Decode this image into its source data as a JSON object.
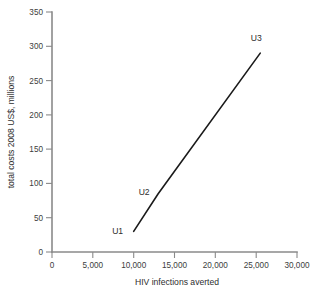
{
  "chart_data": {
    "type": "line",
    "title": "",
    "subtitle": "",
    "xlabel": "HIV infections averted",
    "ylabel": "total costs 2008 US$, millions",
    "xlim": [
      0,
      30000
    ],
    "ylim": [
      0,
      350
    ],
    "xticks": [
      0,
      5000,
      10000,
      15000,
      20000,
      25000,
      30000
    ],
    "xticklabels": [
      "0",
      "5,000",
      "10,000",
      "15,000",
      "20,000",
      "25,000",
      "30,000"
    ],
    "yticks": [
      0,
      50,
      100,
      150,
      200,
      250,
      300,
      350
    ],
    "yticklabels": [
      "0",
      "50",
      "100",
      "150",
      "200",
      "250",
      "300",
      "350"
    ],
    "grid": false,
    "legend": false,
    "legend_position": "none",
    "series": [
      {
        "name": "cost-effectiveness frontier",
        "color": "#1a1a1a",
        "x": [
          10000,
          13000,
          25500
        ],
        "y": [
          30,
          85,
          290
        ],
        "point_labels": [
          "U1",
          "U2",
          "U3"
        ]
      }
    ],
    "annotations": [
      {
        "text": "U1",
        "x": 10000,
        "y": 30,
        "dx": -16,
        "dy": 3
      },
      {
        "text": "U2",
        "x": 13000,
        "y": 85,
        "dx": -14,
        "dy": 1
      },
      {
        "text": "U3",
        "x": 25500,
        "y": 290,
        "dx": -4,
        "dy": -12
      }
    ]
  },
  "axes": {
    "x_title": "HIV infections averted",
    "y_title": "total costs 2008 US$, millions"
  },
  "colors": {
    "axis": "#8a8a8a",
    "series": "#1a1a1a",
    "text": "#2e2e2e",
    "background": "#ffffff"
  }
}
